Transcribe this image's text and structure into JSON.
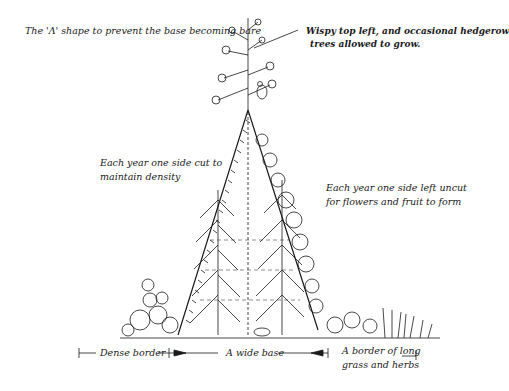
{
  "labels": {
    "top_left": "The 'Λ' shape to prevent the base becoming bare",
    "top_right_line1": "Wispy top left, and occasional hedgerow",
    "top_right_line2": "trees allowed to grow.",
    "mid_left_line1": "Each year one side cut to",
    "mid_left_line2": "maintain density",
    "mid_right_line1": "Each year one side left uncut",
    "mid_right_line2": "for flowers and fruit to form",
    "bottom_left": "Dense border",
    "bottom_center": "A wide base",
    "bottom_right_line1": "A border of long",
    "bottom_right_line2": "grass and herbs"
  },
  "colors": {
    "ink": "#1a1a1a",
    "background": "#ffffff"
  }
}
